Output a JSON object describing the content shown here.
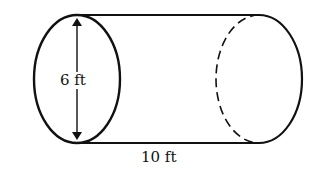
{
  "diagram": {
    "type": "cylinder",
    "labels": {
      "diameter": "6 ft",
      "length": "10 ft"
    },
    "colors": {
      "stroke": "#111111",
      "background": "#ffffff"
    }
  }
}
